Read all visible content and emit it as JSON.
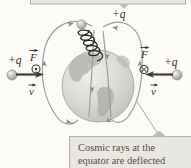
{
  "palette": {
    "background": "#fcfbf7",
    "field_line": "#9a9a96",
    "vector": "#3f3d3b",
    "label_text": "#362f28",
    "caption_text": "#5a4a3c",
    "callout_fill": "#e9e7e1",
    "callout_border": "#b1afab",
    "globe_land": "#b0b4a9"
  },
  "labels": {
    "top_charge": "+q",
    "left_charge": "+q",
    "right_charge": "+q",
    "left_force": "F",
    "left_velocity": "v",
    "right_force": "F",
    "right_velocity": "v"
  },
  "symbols": {
    "left_force_direction": "out-of-page",
    "right_force_direction": "into-page"
  },
  "caption": {
    "line1": "Cosmic rays at the",
    "line2": "equator are deflected"
  }
}
